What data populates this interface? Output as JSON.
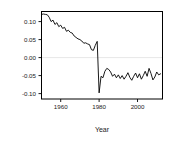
{
  "chart_data": {
    "type": "line",
    "title": "",
    "subtitle": "",
    "xlabel": "Year",
    "ylabel": "",
    "xlim": [
      1950,
      2013
    ],
    "ylim": [
      -0.115,
      0.128
    ],
    "grid": false,
    "zero_reference_line": 0.0,
    "legend": null,
    "legend_position": "none",
    "annotations": [],
    "xticks": [
      1960,
      1980,
      2000
    ],
    "xtick_labels": [
      "1960",
      "1980",
      "2000"
    ],
    "yticks": [
      -0.1,
      -0.05,
      0.0,
      0.05,
      0.1
    ],
    "ytick_labels": [
      "-0.10",
      "-0.05",
      "0.00",
      "0.05",
      "0.10"
    ],
    "series": [
      {
        "name": "series-1",
        "color": "#000000",
        "x": [
          1950,
          1951,
          1952,
          1953,
          1954,
          1955,
          1956,
          1957,
          1958,
          1959,
          1960,
          1961,
          1962,
          1963,
          1964,
          1965,
          1966,
          1967,
          1968,
          1969,
          1970,
          1971,
          1972,
          1973,
          1974,
          1975,
          1976,
          1977,
          1978,
          1979,
          1980,
          1981,
          1982,
          1983,
          1984,
          1985,
          1986,
          1987,
          1988,
          1989,
          1990,
          1991,
          1992,
          1993,
          1994,
          1995,
          1996,
          1997,
          1998,
          1999,
          2000,
          2001,
          2002,
          2003,
          2004,
          2005,
          2006,
          2007,
          2008,
          2009,
          2010,
          2011,
          2012
        ],
        "values": [
          0.12,
          0.121,
          0.12,
          0.119,
          0.112,
          0.1,
          0.104,
          0.092,
          0.097,
          0.086,
          0.09,
          0.081,
          0.084,
          0.073,
          0.076,
          0.07,
          0.068,
          0.06,
          0.056,
          0.052,
          0.05,
          0.046,
          0.04,
          0.041,
          0.038,
          0.036,
          0.022,
          0.02,
          0.034,
          0.045,
          -0.098,
          -0.052,
          -0.056,
          -0.038,
          -0.03,
          -0.033,
          -0.04,
          -0.052,
          -0.046,
          -0.056,
          -0.048,
          -0.058,
          -0.05,
          -0.06,
          -0.052,
          -0.042,
          -0.055,
          -0.063,
          -0.052,
          -0.043,
          -0.056,
          -0.045,
          -0.06,
          -0.05,
          -0.038,
          -0.052,
          -0.03,
          -0.044,
          -0.062,
          -0.054,
          -0.04,
          -0.048,
          -0.045
        ]
      }
    ]
  },
  "axes": {
    "x_title": "Year",
    "y_title": ""
  }
}
